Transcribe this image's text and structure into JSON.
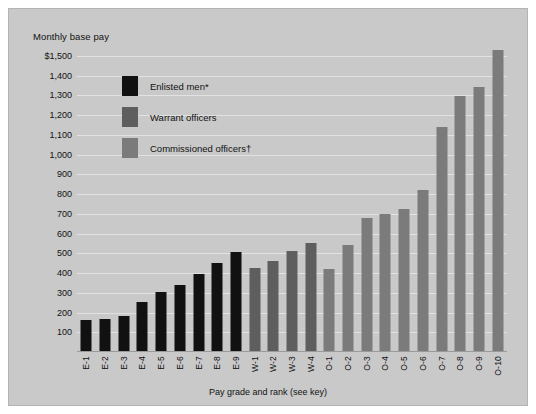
{
  "chart_data": {
    "type": "bar",
    "title": "Monthly base pay",
    "xlabel": "Pay grade and rank (see key)",
    "ylabel": "",
    "ylim": [
      0,
      1500
    ],
    "grid": true,
    "ytick_labels": [
      "$1,500",
      "1,400",
      "1,300",
      "1,200",
      "1,100",
      "1,000",
      "900",
      "800",
      "700",
      "600",
      "500",
      "400",
      "300",
      "200",
      "100"
    ],
    "ytick_values": [
      1500,
      1400,
      1300,
      1200,
      1100,
      1000,
      900,
      800,
      700,
      600,
      500,
      400,
      300,
      200,
      100
    ],
    "legend_position": "upper-left-inside",
    "legend": [
      {
        "label": "Enlisted men*",
        "key": "enlisted",
        "color": "#111111"
      },
      {
        "label": "Warrant officers",
        "key": "warrant",
        "color": "#5e5e5e"
      },
      {
        "label": "Commissioned officers†",
        "key": "commissioned",
        "color": "#7b7b7b"
      }
    ],
    "categories": [
      "E-1",
      "E-2",
      "E-3",
      "E-4",
      "E-5",
      "E-6",
      "E-7",
      "E-8",
      "E-9",
      "W-1",
      "W-2",
      "W-3",
      "W-4",
      "O-1",
      "O-2",
      "O-3",
      "O-4",
      "O-5",
      "O-6",
      "O-7",
      "O-8",
      "O-9",
      "O-10"
    ],
    "groups": [
      "enlisted",
      "enlisted",
      "enlisted",
      "enlisted",
      "enlisted",
      "enlisted",
      "enlisted",
      "enlisted",
      "enlisted",
      "warrant",
      "warrant",
      "warrant",
      "warrant",
      "commissioned",
      "commissioned",
      "commissioned",
      "commissioned",
      "commissioned",
      "commissioned",
      "commissioned",
      "commissioned",
      "commissioned",
      "commissioned"
    ],
    "values": [
      160,
      165,
      185,
      255,
      305,
      340,
      395,
      450,
      505,
      425,
      460,
      510,
      550,
      420,
      540,
      680,
      700,
      725,
      820,
      1140,
      1295,
      1345,
      1530
    ]
  }
}
